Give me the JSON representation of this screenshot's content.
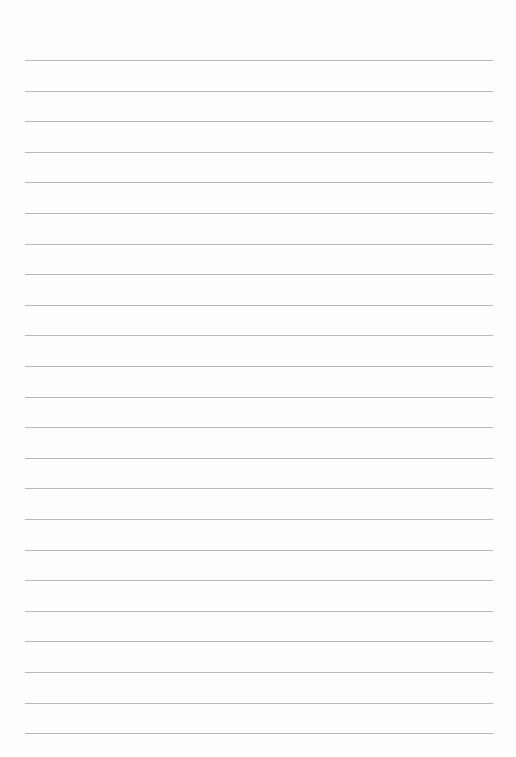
{
  "page": {
    "type": "lined-paper",
    "line_count": 23,
    "first_line_y": 60,
    "line_spacing": 30.6,
    "line_left": 25,
    "line_right": 493,
    "line_color": "#b9b9b9",
    "background_color": "#fefefe"
  }
}
